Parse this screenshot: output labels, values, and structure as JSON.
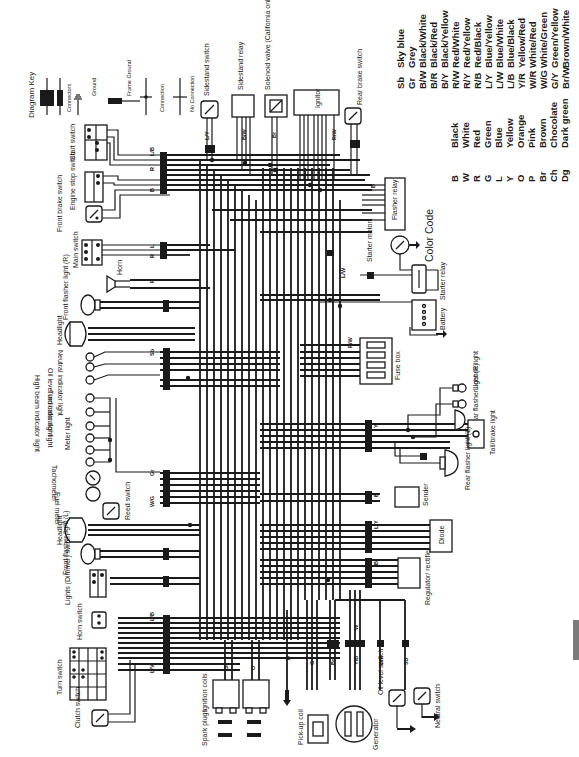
{
  "diagram_key": {
    "title": "Diagram Key",
    "items": [
      "Connectors",
      "Ground",
      "Frame Ground",
      "Connection",
      "No Connection"
    ]
  },
  "components": {
    "sidestand_switch": "Sidestand switch",
    "sidestand_relay": "Sidestand relay",
    "solenoid_valve": "Solenoid valve (California only)",
    "ignitor": "Ignitor",
    "rear_brake_switch": "Rear brake switch",
    "start_switch": "Start switch",
    "engine_stop_switch": "Engine stop switch",
    "front_brake_switch": "Front brake switch",
    "main_switch": "Main switch",
    "horn": "Horn",
    "front_flasher_r": "Front flasher light (R)",
    "headlight_top": "Headlight",
    "oil_level_indicator": "Oil level indicator light",
    "neutral_indicator": "Neutral indicator light",
    "high_beam_indicator": "High beam indicator light",
    "turn_indicator": "Turn indicator light",
    "meter_light": "Meter light",
    "tachometer": "Tachometer",
    "fuel_meter": "Fuel meter",
    "reed_switch": "Reed switch",
    "headlight_bottom": "Headlight",
    "front_flasher_l": "Front flasher light (L)",
    "lights_dimmer_switch": "Lights (Dimmer) switch",
    "horn_switch": "Horn switch",
    "turn_switch": "Turn switch",
    "clutch_switch": "Clutch switch",
    "ignition_coils": "Ignition coils",
    "spark_plugs": "Spark plugs",
    "pickup_coil": "Pick-up coil",
    "generator": "Generator",
    "oil_level_switch": "Oil level switch",
    "neutral_switch": "Neutral switch",
    "flasher_relay": "Flasher relay",
    "starter_motor": "Starter motor",
    "starter_relay": "Starter relay",
    "battery": "Battery",
    "fuse_box": "Fuse box",
    "license_light": "License light",
    "rear_flasher_r": "Rear flasher light (R)",
    "tail_brake_light": "Tail/brake light",
    "rear_flasher_l": "Rear flasher light (L)",
    "sender": "Sender",
    "diode": "Diode",
    "regulator_rectifier": "Regulator/ rectifier"
  },
  "color_code": {
    "title": "Color Code",
    "single": [
      {
        "code": "B",
        "name": "Black"
      },
      {
        "code": "W",
        "name": "White"
      },
      {
        "code": "R",
        "name": "Red"
      },
      {
        "code": "G",
        "name": "Green"
      },
      {
        "code": "L",
        "name": "Blue"
      },
      {
        "code": "Y",
        "name": "Yellow"
      },
      {
        "code": "O",
        "name": "Orange"
      },
      {
        "code": "P",
        "name": "Pink"
      },
      {
        "code": "Br",
        "name": "Brown"
      },
      {
        "code": "Ch",
        "name": "Chocolate"
      },
      {
        "code": "Dg",
        "name": "Dark green"
      }
    ],
    "combo": [
      {
        "code": "Sb",
        "name": "Sky blue"
      },
      {
        "code": "Gr",
        "name": "Grey"
      },
      {
        "code": "B/W",
        "name": "Black/White"
      },
      {
        "code": "B/R",
        "name": "Black/Red"
      },
      {
        "code": "B/Y",
        "name": "Black/Yellow"
      },
      {
        "code": "R/W",
        "name": "Red/White"
      },
      {
        "code": "R/Y",
        "name": "Red/Yellow"
      },
      {
        "code": "R/B",
        "name": "Red/Black"
      },
      {
        "code": "L/Y",
        "name": "Blue/Yellow"
      },
      {
        "code": "L/W",
        "name": "Blue/White"
      },
      {
        "code": "L/B",
        "name": "Blue/Black"
      },
      {
        "code": "Y/R",
        "name": "Yellow/Red"
      },
      {
        "code": "W/R",
        "name": "White/Red"
      },
      {
        "code": "W/G",
        "name": "White/Green"
      },
      {
        "code": "G/Y",
        "name": "Green/Yellow"
      },
      {
        "code": "Br/W",
        "name": "Brown/White"
      }
    ]
  },
  "wire_labels": {
    "start_switch": [
      "L/B",
      "R/Y",
      "R",
      "L/W",
      "R/W",
      "R/W",
      "G/Y",
      "B"
    ],
    "main_switch": [
      "L",
      "Br",
      "R"
    ],
    "horn": [
      "P",
      "Br"
    ],
    "front_flasher_r": [
      "B",
      "Dg"
    ],
    "headlight_top": [
      "Y",
      "G",
      "B"
    ],
    "indicators": [
      "Sb",
      "Br",
      "B/R",
      "B",
      "Y",
      "L"
    ],
    "meters": [
      "Gr",
      "Br",
      "Dg",
      "Ch",
      "B",
      "W/G"
    ],
    "headlight_bottom": [
      "Y",
      "G",
      "B"
    ],
    "front_flasher_l": [
      "B",
      "Ch"
    ],
    "dimmer": [
      "G",
      "Y"
    ],
    "handlebar_left": [
      "L/B",
      "Y/R",
      "L",
      "P",
      "Dg",
      "B/W",
      "Ch",
      "L/Y",
      "L/V"
    ],
    "sidestand_switch": [
      "L/Y",
      "B"
    ],
    "sidestand_relay": [
      "B",
      "R/B",
      "L/Y",
      "B/W"
    ],
    "solenoid": [
      "B",
      "Br"
    ],
    "ignitor": [
      "B",
      "Gr",
      "O",
      "B/W",
      "Gr",
      "O",
      "B",
      "R/W"
    ],
    "rear_brake": [
      "Br",
      "Y"
    ],
    "flasher_relay": [
      "B",
      "Br",
      "W/G",
      "W/Y",
      "B/Y"
    ],
    "flasher_relay_lower": [
      "B/W",
      "W/Y"
    ],
    "starter": [
      "L/W"
    ],
    "fuse_box": [
      "R/W",
      "R/W",
      "Br",
      "R/Y",
      "L/W",
      "W/R"
    ],
    "tail": [
      "Y",
      "B",
      "L",
      "Dg",
      "Ch"
    ],
    "sender": [
      "B",
      "O"
    ],
    "diode": [
      "L/Y",
      "B/R",
      "B/Y",
      "B/W",
      "B/R"
    ],
    "regulator": [
      "B",
      "W/R",
      "Br",
      "B"
    ],
    "ignition_coils": [
      "Gr",
      "R/W",
      "O",
      "R/W"
    ],
    "ground": [
      "B"
    ],
    "pickup": [
      "B",
      "G",
      "O"
    ],
    "pickup2": [
      "Br",
      "O"
    ],
    "generator": [
      "Y/B",
      "Y/B",
      "Y/B"
    ],
    "generator_w": [
      "W",
      "W",
      "W"
    ],
    "oil_level": [
      "B/R"
    ],
    "neutral": [
      "Sb"
    ]
  },
  "switch_cells": [
    "OFF",
    "ON",
    "OFF",
    "RUN",
    "OFF",
    "ON",
    "P",
    "HI",
    "LO",
    "R",
    "N",
    "L"
  ]
}
